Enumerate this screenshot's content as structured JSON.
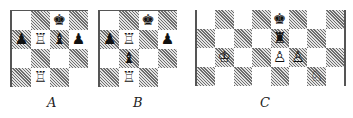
{
  "diagrams": [
    {
      "id": "A",
      "label": "A",
      "cols": 4,
      "rows": 4,
      "first_square": "light",
      "pieces": [
        {
          "row": 0,
          "col": 2,
          "type": "king",
          "color": "black",
          "glyph": "♚",
          "name": "black-king-icon"
        },
        {
          "row": 1,
          "col": 0,
          "type": "pawn",
          "color": "black",
          "glyph": "♟",
          "name": "black-pawn-icon"
        },
        {
          "row": 1,
          "col": 1,
          "type": "rook",
          "color": "white",
          "glyph": "♖",
          "name": "white-rook-icon"
        },
        {
          "row": 1,
          "col": 2,
          "type": "bishop",
          "color": "black",
          "glyph": "♝",
          "name": "black-bishop-icon"
        },
        {
          "row": 1,
          "col": 3,
          "type": "pawn",
          "color": "black",
          "glyph": "♟",
          "name": "black-pawn-icon"
        },
        {
          "row": 3,
          "col": 1,
          "type": "rook",
          "color": "white",
          "glyph": "♖",
          "name": "white-rook-icon"
        }
      ]
    },
    {
      "id": "B",
      "label": "B",
      "cols": 4,
      "rows": 4,
      "first_square": "light",
      "pieces": [
        {
          "row": 0,
          "col": 2,
          "type": "king",
          "color": "black",
          "glyph": "♚",
          "name": "black-king-icon"
        },
        {
          "row": 1,
          "col": 0,
          "type": "pawn",
          "color": "black",
          "glyph": "♟",
          "name": "black-pawn-icon"
        },
        {
          "row": 1,
          "col": 1,
          "type": "rook",
          "color": "white",
          "glyph": "♖",
          "name": "white-rook-icon"
        },
        {
          "row": 1,
          "col": 3,
          "type": "pawn",
          "color": "black",
          "glyph": "♟",
          "name": "black-pawn-icon"
        },
        {
          "row": 2,
          "col": 1,
          "type": "bishop",
          "color": "black",
          "glyph": "♝",
          "name": "black-bishop-icon"
        },
        {
          "row": 3,
          "col": 1,
          "type": "rook",
          "color": "white",
          "glyph": "♖",
          "name": "white-rook-icon"
        }
      ]
    },
    {
      "id": "C",
      "label": "C",
      "cols": 8,
      "rows": 4,
      "first_square": "light",
      "pieces": [
        {
          "row": 0,
          "col": 4,
          "type": "king",
          "color": "black",
          "glyph": "♚",
          "name": "black-king-icon"
        },
        {
          "row": 1,
          "col": 4,
          "type": "rook",
          "color": "black",
          "glyph": "♜",
          "name": "black-rook-icon"
        },
        {
          "row": 2,
          "col": 1,
          "type": "king",
          "color": "white",
          "glyph": "♔",
          "name": "white-king-icon"
        },
        {
          "row": 2,
          "col": 4,
          "type": "pawn",
          "color": "white",
          "glyph": "♙",
          "name": "white-pawn-icon"
        },
        {
          "row": 2,
          "col": 5,
          "type": "pawn",
          "color": "white",
          "glyph": "♙",
          "name": "white-pawn-icon"
        },
        {
          "row": 3,
          "col": 6,
          "type": "knight",
          "color": "white",
          "glyph": "♘",
          "name": "white-knight-icon"
        }
      ]
    }
  ]
}
